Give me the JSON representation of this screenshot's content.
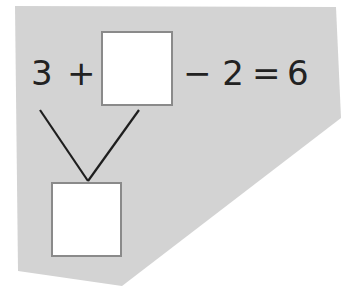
{
  "puzzle": {
    "left_operand": "3",
    "plus": "+",
    "minus_part": "− 2",
    "equals": "=",
    "result": "6",
    "top_box_value": "",
    "bottom_box_value": ""
  },
  "colors": {
    "panel": "#d3d3d3",
    "box_fill": "#ffffff",
    "box_border": "#8a8a8a",
    "line": "#1e1e1e",
    "text": "#222222"
  }
}
